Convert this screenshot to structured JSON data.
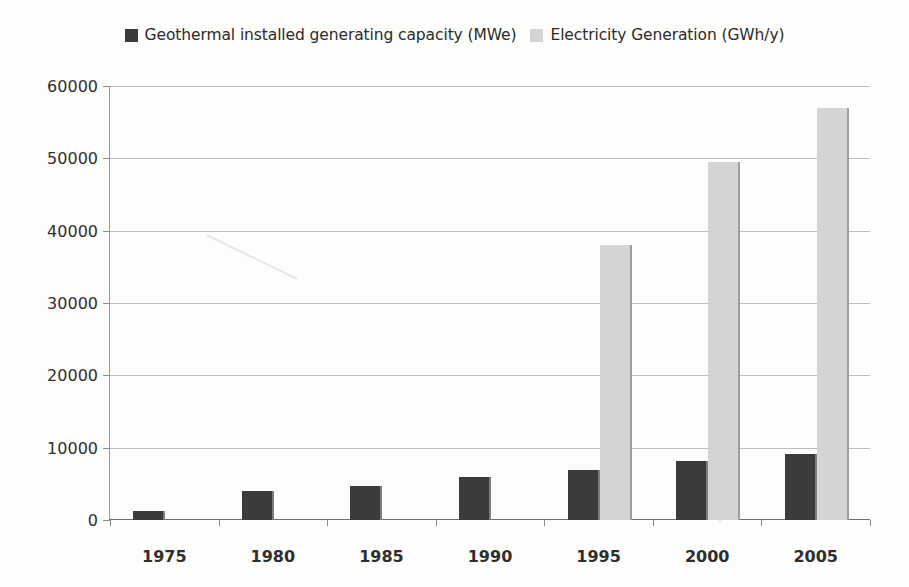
{
  "chart_data": {
    "type": "bar",
    "title": "",
    "xlabel": "",
    "ylabel": "",
    "grid": true,
    "legend_position": "top-center",
    "categories": [
      "1975",
      "1980",
      "1985",
      "1990",
      "1995",
      "2000",
      "2005"
    ],
    "ylim": [
      0,
      60000
    ],
    "ytick_values": [
      0,
      10000,
      20000,
      30000,
      40000,
      50000,
      60000
    ],
    "ytick_labels": [
      "0",
      "10000",
      "20000",
      "30000",
      "40000",
      "50000",
      "60000"
    ],
    "series": [
      {
        "name": "Geothermal installed generating capacity (MWe)",
        "color": "#3b3b3b",
        "values": [
          1300,
          4000,
          4700,
          5950,
          6900,
          8150,
          9100
        ]
      },
      {
        "name": "Electricity Generation (GWh/y)",
        "color": "#d4d4d4",
        "values": [
          0,
          0,
          0,
          0,
          38000,
          49500,
          57000
        ]
      }
    ]
  },
  "legend": {
    "entries": [
      {
        "label": "Geothermal installed generating capacity (MWe)",
        "swatch": "dark-square-icon"
      },
      {
        "label": "Electricity Generation (GWh/y)",
        "swatch": "light-square-icon"
      }
    ]
  }
}
